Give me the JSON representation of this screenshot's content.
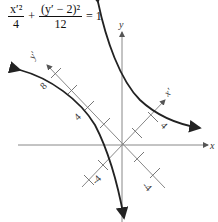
{
  "equation": {
    "term1_num": "x′²",
    "term1_den": "4",
    "plus": "+",
    "term2_num": "(y′ − 2)²",
    "term2_den": "12",
    "rhs": "= 1"
  },
  "axes": {
    "x_label": "x",
    "y_label": "y",
    "xprime_label": "x′",
    "yprime_label": "y′"
  },
  "ticks": {
    "yprime_8": "8",
    "yprime_4": "4",
    "xprime_4": "4",
    "neg_yprime": "-4",
    "neg_xprime": "-4"
  },
  "colors": {
    "axis": "#888888",
    "curve": "#222222"
  }
}
